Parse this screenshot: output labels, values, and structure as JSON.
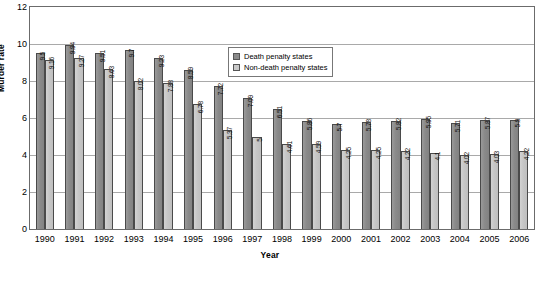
{
  "chart_data": {
    "type": "bar",
    "title": "",
    "xlabel": "Year",
    "ylabel": "Murder rate",
    "ylim": [
      0,
      12
    ],
    "yticks": [
      0,
      2,
      4,
      6,
      8,
      10,
      12
    ],
    "grid": true,
    "legend_position": "top-right",
    "categories": [
      "1990",
      "1991",
      "1992",
      "1993",
      "1994",
      "1995",
      "1996",
      "1997",
      "1998",
      "1999",
      "2000",
      "2001",
      "2002",
      "2003",
      "2004",
      "2005",
      "2006"
    ],
    "series": [
      {
        "name": "Death penalty states",
        "color": "#8a8a8a",
        "values": [
          9.5,
          9.94,
          9.51,
          9.7,
          9.23,
          8.59,
          7.72,
          7.09,
          6.51,
          5.86,
          5.7,
          5.78,
          5.82,
          5.95,
          5.71,
          5.87,
          5.9
        ],
        "labels": [
          "9.5",
          "9.94",
          "9.51",
          "9.7",
          "9.23",
          "8.59",
          "7.72",
          "7.09",
          "6.51",
          "5.86",
          "5.7",
          "5.78",
          "5.82",
          "5.95",
          "5.71",
          "5.87",
          "5.9"
        ]
      },
      {
        "name": "Non-death penalty states",
        "color": "#c9c9c9",
        "values": [
          9.16,
          9.27,
          8.63,
          8.02,
          7.88,
          6.78,
          5.37,
          5,
          4.61,
          4.59,
          4.25,
          4.25,
          4.22,
          4.1,
          4.02,
          4.03,
          4.22
        ],
        "labels": [
          "9.16",
          "9.27",
          "8.63",
          "8.02",
          "7.88",
          "6.78",
          "5.37",
          "5",
          "4.61",
          "4.59",
          "4.25",
          "4.25",
          "4.22",
          "4.1",
          "4.02",
          "4.03",
          "4.22"
        ]
      }
    ]
  },
  "legend": {
    "items": [
      {
        "label": "Death penalty states",
        "color": "#8a8a8a"
      },
      {
        "label": "Non-death penalty states",
        "color": "#c9c9c9"
      }
    ]
  }
}
